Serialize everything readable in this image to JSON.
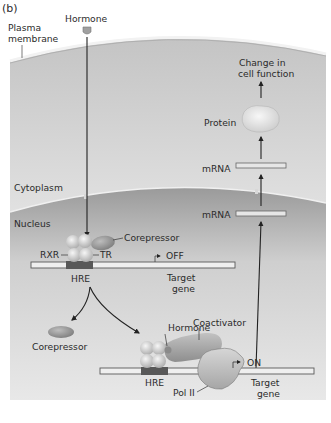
{
  "panel_label": "(b)",
  "labels": {
    "hormone_top": "Hormone",
    "plasma_membrane_1": "Plasma",
    "plasma_membrane_2": "membrane",
    "cytoplasm": "Cytoplasm",
    "nucleus": "Nucleus",
    "change_1": "Change in",
    "change_2": "cell function",
    "protein": "Protein",
    "mrna_cyto": "mRNA",
    "mrna_nuc": "mRNA",
    "corepressor_bound": "Corepressor",
    "rxr": "RXR",
    "tr": "TR",
    "off": "OFF",
    "hre_1": "HRE",
    "target_gene_1a": "Target",
    "target_gene_1b": "gene",
    "corepressor_free": "Corepressor",
    "hormone_bound": "Hormone",
    "coactivator": "Coactivator",
    "on": "ON",
    "hre_2": "HRE",
    "pol2": "Pol II",
    "target_gene_2a": "Target",
    "target_gene_2b": "gene"
  },
  "colors": {
    "cytoplasm": "#d4d4d4",
    "nucleus": "#b3b3b3",
    "membrane": "#ededed",
    "protein_blob": "#e6e6e6",
    "receptor": "#d9d9d9",
    "corepressor": "#9a9a9a",
    "coactivator": "#a8a8a8",
    "hre": "#555555",
    "arrow": "#222222"
  }
}
